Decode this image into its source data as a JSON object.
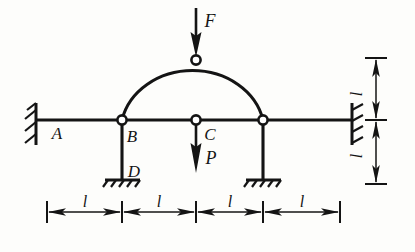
{
  "figure": {
    "type": "structural-mechanics-diagram",
    "background_color": "#fdfdfb",
    "line_color": "#141414"
  },
  "nodes": [
    {
      "id": "A",
      "label": "A",
      "x": 47,
      "y": 120,
      "kind": "wall-support-left",
      "hinge": false
    },
    {
      "id": "B",
      "label": "B",
      "x": 122,
      "y": 120,
      "kind": "hinge-joint",
      "hinge": true
    },
    {
      "id": "C",
      "label": "C",
      "x": 196,
      "y": 120,
      "kind": "hinge-joint",
      "hinge": true
    },
    {
      "id": "E",
      "label": "",
      "x": 263,
      "y": 120,
      "kind": "hinge-joint",
      "hinge": true
    },
    {
      "id": "K",
      "label": "",
      "x": 196,
      "y": 60,
      "kind": "crown-hinge",
      "hinge": true
    },
    {
      "id": "D",
      "label": "D",
      "x": 122,
      "y": 180,
      "kind": "fixed-ground-support",
      "hinge": false
    },
    {
      "id": "G",
      "label": "",
      "x": 263,
      "y": 180,
      "kind": "fixed-ground-support",
      "hinge": false
    },
    {
      "id": "R",
      "label": "",
      "x": 340,
      "y": 120,
      "kind": "wall-support-right",
      "hinge": false
    }
  ],
  "members": {
    "beam_label": "horizontal beam A to right wall",
    "beam_y": 120,
    "beam_x_start": 36,
    "beam_x_end": 352,
    "left_column_label": "column B-D",
    "right_column_label": "column E-G",
    "arch_label": "semicircular three-hinged arch B-K-E",
    "arch_radius": 70,
    "arch_center_x": 196,
    "arch_center_y": 124
  },
  "forces": [
    {
      "id": "F",
      "label": "F",
      "magnitude_symbol": "F",
      "direction": "down",
      "applied_at": "crown hinge K",
      "tail_x": 196,
      "tail_y": 8,
      "head_x": 196,
      "head_y": 56,
      "label_x": 207,
      "label_y": 24
    },
    {
      "id": "P",
      "label": "P",
      "magnitude_symbol": "P",
      "direction": "down",
      "applied_at": "joint C",
      "tail_x": 196,
      "tail_y": 124,
      "head_x": 196,
      "head_y": 172,
      "label_x": 207,
      "label_y": 161
    }
  ],
  "dimensions": {
    "horizontal": {
      "y": 212,
      "tick_top": 200,
      "tick_bottom": 224,
      "segments": [
        {
          "label": "l",
          "x_start": 47,
          "x_end": 122,
          "label_x": 84,
          "label_y": 205
        },
        {
          "label": "l",
          "x_start": 122,
          "x_end": 196,
          "label_x": 159,
          "label_y": 205
        },
        {
          "label": "l",
          "x_start": 196,
          "x_end": 263,
          "label_x": 229,
          "label_y": 205
        },
        {
          "label": "l",
          "x_start": 263,
          "x_end": 340,
          "label_x": 301,
          "label_y": 205
        }
      ]
    },
    "vertical": {
      "x": 376,
      "tick_left": 364,
      "tick_right": 388,
      "segments": [
        {
          "label": "l",
          "y_start": 58,
          "y_end": 120,
          "label_x": 362,
          "label_y": 90
        },
        {
          "label": "l",
          "y_start": 120,
          "y_end": 184,
          "label_x": 362,
          "label_y": 154
        }
      ]
    }
  },
  "point_labels": [
    {
      "text": "A",
      "x": 57,
      "y": 137
    },
    {
      "text": "B",
      "x": 130,
      "y": 140
    },
    {
      "text": "C",
      "x": 207,
      "y": 139
    },
    {
      "text": "D",
      "x": 131,
      "y": 176
    }
  ],
  "supports": {
    "left_wall": {
      "x": 36,
      "y_top": 104,
      "y_bottom": 144,
      "hatch_count": 3,
      "side": "left"
    },
    "right_wall": {
      "x": 352,
      "y_top": 104,
      "y_bottom": 144,
      "hatch_count": 3,
      "side": "right"
    },
    "ground_D": {
      "x": 122,
      "y": 180,
      "half_width": 17,
      "hatch_count": 5
    },
    "ground_G": {
      "x": 263,
      "y": 180,
      "half_width": 17,
      "hatch_count": 5
    }
  }
}
